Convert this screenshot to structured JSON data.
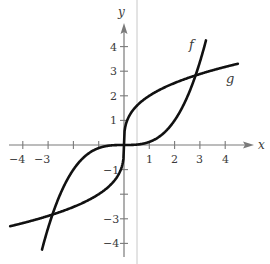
{
  "chart_data": {
    "type": "line",
    "title": "",
    "xlabel": "x",
    "ylabel": "y",
    "xlim": [
      -4.5,
      5
    ],
    "ylim": [
      -4.5,
      5
    ],
    "grid": false,
    "legend": "inline curve labels",
    "x_ticks": [
      -4,
      -3,
      -2,
      -1,
      1,
      2,
      3,
      4
    ],
    "x_tick_labels": [
      "−4",
      "−3",
      "",
      "",
      "1",
      "2",
      "3",
      "4"
    ],
    "y_ticks": [
      -4,
      -3,
      -2,
      -1,
      1,
      2,
      3,
      4
    ],
    "y_tick_labels": [
      "−4",
      "−3",
      "",
      "−1",
      "1",
      "2",
      "3",
      "4"
    ],
    "series": [
      {
        "name": "f",
        "description": "cubic curve f(x) = x^3/8",
        "x": [
          -3.24,
          -3,
          -2.83,
          -2.5,
          -2,
          -1.5,
          -1,
          -0.5,
          0,
          0.5,
          1,
          1.5,
          2,
          2.5,
          2.83,
          3,
          3.24
        ],
        "y": [
          -4.25,
          -3.38,
          -2.83,
          -1.95,
          -1.0,
          -0.42,
          -0.13,
          -0.02,
          0,
          0.02,
          0.13,
          0.42,
          1.0,
          1.95,
          2.83,
          3.38,
          4.25
        ]
      },
      {
        "name": "g",
        "description": "cube-root curve g(x) = 2·x^(1/3)",
        "x": [
          -4.5,
          -4,
          -3,
          -2.83,
          -2,
          -1,
          -0.5,
          -0.1,
          0,
          0.1,
          0.5,
          1,
          2,
          2.83,
          3,
          4,
          4.5
        ],
        "y": [
          -3.3,
          -3.17,
          -2.88,
          -2.83,
          -2.52,
          -2.0,
          -1.59,
          -0.93,
          0,
          0.93,
          1.59,
          2.0,
          2.52,
          2.83,
          2.88,
          3.17,
          3.3
        ]
      }
    ],
    "intersections": [
      [
        -2.83,
        -2.83
      ],
      [
        0,
        0
      ],
      [
        2.83,
        2.83
      ]
    ],
    "annotations": [
      {
        "text": "f",
        "near": [
          2.7,
          4.1
        ]
      },
      {
        "text": "g",
        "near": [
          4.1,
          2.6
        ]
      }
    ]
  },
  "labels": {
    "x_axis": "x",
    "y_axis": "y",
    "f": "f",
    "g": "g",
    "xt": {
      "m4": "−4",
      "m3": "−3",
      "p1": "1",
      "p2": "2",
      "p3": "3",
      "p4": "4"
    },
    "yt": {
      "p4": "4",
      "p3": "3",
      "p2": "2",
      "p1": "1",
      "m1": "−1",
      "m3": "−3",
      "m4": "−4"
    }
  }
}
